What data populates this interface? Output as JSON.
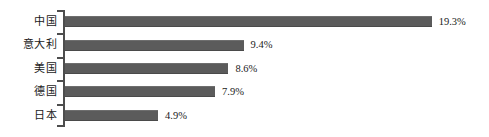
{
  "chart_data": {
    "type": "bar",
    "orientation": "horizontal",
    "title": "",
    "subtitle": "",
    "xlabel": "",
    "ylabel": "",
    "grid": false,
    "legend": null,
    "axis_color": "#4d4d4d",
    "bar_color": "#5b5b5b",
    "background": "#ffffff",
    "xlim": [
      0,
      19.3
    ],
    "value_suffix": "%",
    "categories": [
      "中国",
      "意大利",
      "美国",
      "德国",
      "日本"
    ],
    "values": [
      19.3,
      9.4,
      8.6,
      7.9,
      4.9
    ],
    "value_labels": [
      "19.3%",
      "9.4%",
      "8.6%",
      "7.9%",
      "4.9%"
    ],
    "bars": [
      {
        "category": "中国",
        "value": 19.3,
        "label": "19.3%"
      },
      {
        "category": "意大利",
        "value": 9.4,
        "label": "9.4%"
      },
      {
        "category": "美国",
        "value": 8.6,
        "label": "8.6%"
      },
      {
        "category": "德国",
        "value": 7.9,
        "label": "7.9%"
      },
      {
        "category": "日本",
        "value": 4.9,
        "label": "4.9%"
      }
    ]
  }
}
